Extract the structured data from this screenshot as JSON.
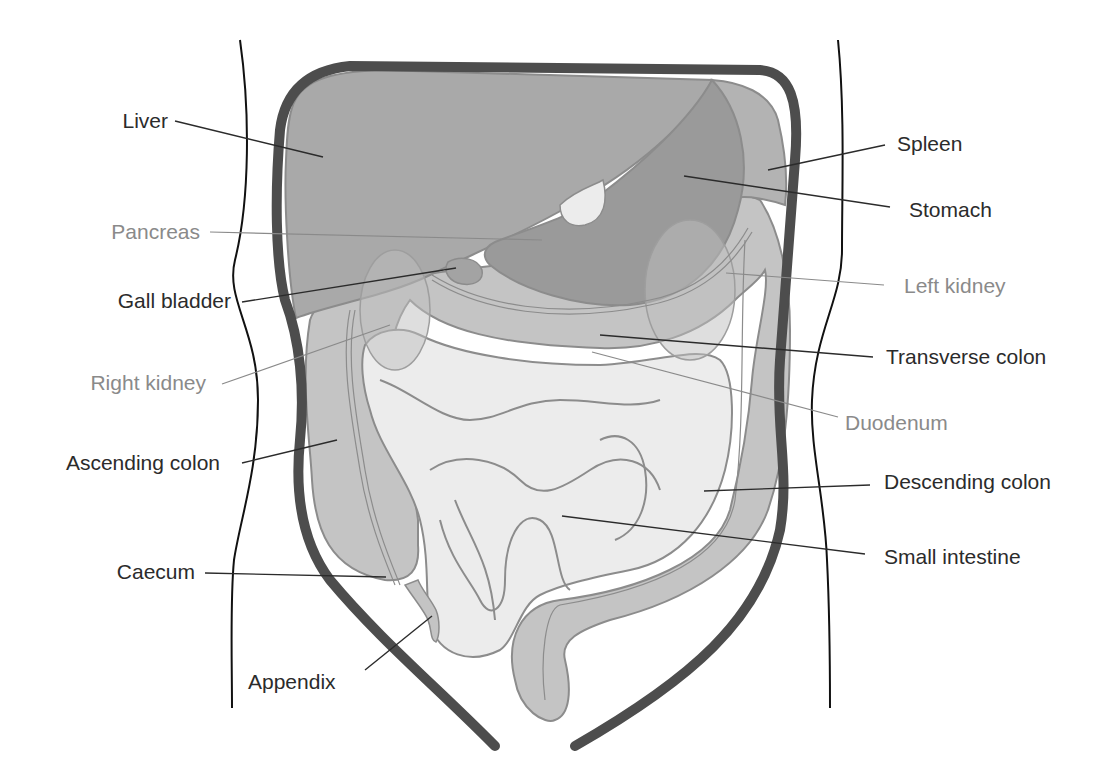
{
  "diagram": {
    "colors": {
      "background": "#ffffff",
      "body_outline": "#111111",
      "abdominal_wall": "#4d4d4d",
      "liver": "#a9a9a9",
      "stomach": "#9a9a9a",
      "spleen": "#b3b3b3",
      "colon": "#c4c4c4",
      "small_intestine": "#ececec",
      "organ_edge": "#8c8c8c",
      "label_dark": "#2b2b2b",
      "label_light": "#8a8a8a"
    },
    "labels_left": [
      {
        "id": "liver",
        "text": "Liver",
        "style": "dark"
      },
      {
        "id": "pancreas",
        "text": "Pancreas",
        "style": "light"
      },
      {
        "id": "gall_bladder",
        "text": "Gall bladder",
        "style": "dark"
      },
      {
        "id": "right_kidney",
        "text": "Right kidney",
        "style": "light"
      },
      {
        "id": "ascending_colon",
        "text": "Ascending colon",
        "style": "dark"
      },
      {
        "id": "caecum",
        "text": "Caecum",
        "style": "dark"
      },
      {
        "id": "appendix",
        "text": "Appendix",
        "style": "dark"
      }
    ],
    "labels_right": [
      {
        "id": "spleen",
        "text": "Spleen",
        "style": "dark"
      },
      {
        "id": "stomach",
        "text": "Stomach",
        "style": "dark"
      },
      {
        "id": "left_kidney",
        "text": "Left kidney",
        "style": "light"
      },
      {
        "id": "transverse_colon",
        "text": "Transverse colon",
        "style": "dark"
      },
      {
        "id": "duodenum",
        "text": "Duodenum",
        "style": "light"
      },
      {
        "id": "descending_colon",
        "text": "Descending colon",
        "style": "dark"
      },
      {
        "id": "small_intestine",
        "text": "Small intestine",
        "style": "dark"
      }
    ]
  }
}
